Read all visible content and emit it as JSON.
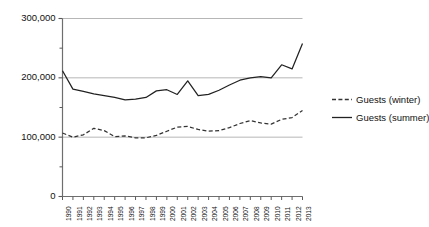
{
  "chart_data": {
    "type": "line",
    "title": "",
    "subtitle": "",
    "xlabel": "",
    "ylabel": "",
    "grid": true,
    "gridlines_y": [
      100000,
      200000,
      300000
    ],
    "legend_position": "right",
    "ylim": [
      0,
      300000
    ],
    "y_ticks_major": [
      0,
      100000,
      200000,
      300000
    ],
    "y_tick_labels": [
      "0",
      "100,000",
      "200,000",
      "300,000"
    ],
    "y_ticks_minor": [
      50000,
      150000,
      250000
    ],
    "categories": [
      "1990",
      "1991",
      "1992",
      "1993",
      "1994",
      "1995",
      "1996",
      "1997",
      "1998",
      "1999",
      "2000",
      "2001",
      "2002",
      "2003",
      "2004",
      "2005",
      "2006",
      "2007",
      "2008",
      "2009",
      "2010",
      "2011",
      "2012",
      "2013"
    ],
    "series": [
      {
        "name": "Guests (summer)",
        "style": "solid",
        "color": "#222222",
        "values": [
          212000,
          181000,
          177000,
          173000,
          170000,
          167000,
          163000,
          164000,
          167000,
          178000,
          180000,
          172000,
          195000,
          170000,
          172000,
          179000,
          188000,
          196000,
          200000,
          202000,
          200000,
          222000,
          215000,
          258000
        ]
      },
      {
        "name": "Guests (winter)",
        "style": "dashed",
        "color": "#333333",
        "values": [
          107000,
          100000,
          104000,
          115000,
          111000,
          101000,
          102000,
          99000,
          99000,
          103000,
          110000,
          117000,
          118000,
          113000,
          110000,
          111000,
          116000,
          123000,
          128000,
          124000,
          122000,
          130000,
          133000,
          145000
        ]
      }
    ],
    "legend": [
      {
        "label": "Guests (winter)",
        "style": "dashed"
      },
      {
        "label": "Guests (summer)",
        "style": "solid"
      }
    ]
  }
}
